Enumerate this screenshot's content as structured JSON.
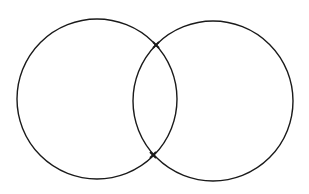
{
  "diagram": {
    "type": "intersecting-circles",
    "background": "#ffffff",
    "stroke_color": "#1a1a1a",
    "circles": [
      {
        "name": "left-circle",
        "cx": 97,
        "cy": 99,
        "r": 80
      },
      {
        "name": "right-circle",
        "cx": 213,
        "cy": 101,
        "r": 80
      }
    ],
    "intersection_points": [
      {
        "name": "top-intersection",
        "x": 156,
        "y": 45,
        "marker": "x"
      },
      {
        "name": "bottom-intersection",
        "x": 153,
        "y": 155,
        "marker": "x"
      }
    ]
  }
}
